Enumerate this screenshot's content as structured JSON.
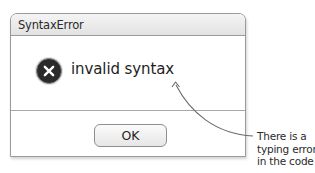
{
  "dialog": {
    "title": "SyntaxError",
    "icon": "error-x-circle-icon",
    "message": "invalid syntax",
    "buttons": [
      {
        "label": "OK"
      }
    ]
  },
  "annotation": {
    "lines": [
      "There is a",
      "typing error",
      "in the code"
    ],
    "arrow_color": "#6a6a6a"
  },
  "colors": {
    "icon_fill": "#2b2b2b",
    "titlebar_top": "#f4f4f4",
    "titlebar_bottom": "#e2e2e2",
    "border": "#9a9a9a"
  }
}
